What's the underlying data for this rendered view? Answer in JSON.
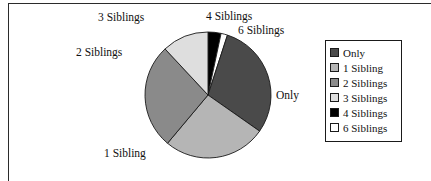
{
  "figure": {
    "background_color": "#ffffff",
    "frame": {
      "top_rule": true,
      "left_rule": true,
      "rule_color": "#2b2b2b"
    }
  },
  "legend": {
    "position": "right",
    "border_color": "#1a1a1a",
    "items": [
      {
        "label": "Only",
        "color": "#4a4a4a"
      },
      {
        "label": "1 Sibling",
        "color": "#b5b5b5"
      },
      {
        "label": "2 Siblings",
        "color": "#8a8a8a"
      },
      {
        "label": "3 Siblings",
        "color": "#dedede"
      },
      {
        "label": "4 Siblings",
        "color": "#000000"
      },
      {
        "label": "6 Siblings",
        "color": "#ffffff"
      }
    ]
  },
  "callout_labels": {
    "only": "Only",
    "one_sibling": "1 Sibling",
    "two_siblings": "2 Siblings",
    "three_siblings": "3 Siblings",
    "four_siblings": "4 Siblings",
    "six_siblings": "6 Siblings"
  },
  "chart_data": {
    "type": "pie",
    "title": "",
    "xlabel": "",
    "ylabel": "",
    "legend_position": "right",
    "grid": false,
    "start_angle_deg": 0,
    "direction": "clockwise",
    "center_px": [
      208,
      95
    ],
    "radius_px": 63,
    "categories": [
      "4 Siblings",
      "6 Siblings",
      "Only",
      "1 Sibling",
      "2 Siblings",
      "3 Siblings"
    ],
    "values": [
      3.3,
      1.7,
      29.7,
      26.4,
      27.0,
      11.9
    ],
    "units": "percent",
    "slices": [
      {
        "label": "4 Siblings",
        "value": 3.3,
        "angle_deg": 12,
        "start_deg": 0,
        "end_deg": 12,
        "color": "#000000"
      },
      {
        "label": "6 Siblings",
        "value": 1.7,
        "angle_deg": 6,
        "start_deg": 12,
        "end_deg": 18,
        "color": "#ffffff"
      },
      {
        "label": "Only",
        "value": 29.7,
        "angle_deg": 107,
        "start_deg": 18,
        "end_deg": 125,
        "color": "#4a4a4a"
      },
      {
        "label": "1 Sibling",
        "value": 26.4,
        "angle_deg": 95,
        "start_deg": 125,
        "end_deg": 220,
        "color": "#b5b5b5"
      },
      {
        "label": "2 Siblings",
        "value": 27.0,
        "angle_deg": 97,
        "start_deg": 220,
        "end_deg": 317,
        "color": "#8a8a8a"
      },
      {
        "label": "3 Siblings",
        "value": 11.9,
        "angle_deg": 43,
        "start_deg": 317,
        "end_deg": 360,
        "color": "#dedede"
      }
    ],
    "slice_outline_color": "#1a1a1a"
  }
}
